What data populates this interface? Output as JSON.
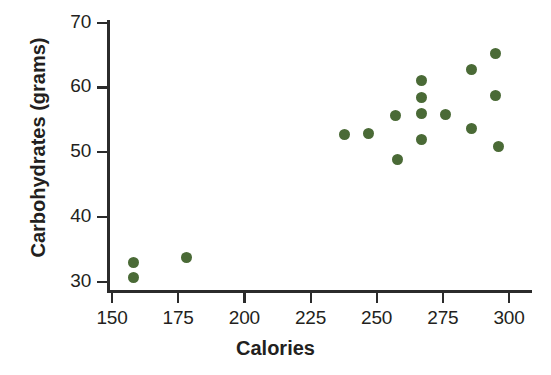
{
  "chart_data": {
    "type": "scatter",
    "title": "",
    "xlabel": "Calories",
    "ylabel": "Carbohydrates (grams)",
    "xlim": [
      150,
      310
    ],
    "ylim": [
      28,
      70
    ],
    "xticks": [
      150,
      175,
      200,
      225,
      250,
      275,
      300
    ],
    "yticks": [
      30,
      40,
      50,
      60,
      70
    ],
    "grid": false,
    "legend": null,
    "marker_color": "#4a6a36",
    "axis_color": "#2b2b2b",
    "background_color": "#ffffff",
    "points": [
      {
        "x": 158,
        "y": 33
      },
      {
        "x": 158,
        "y": 30.7
      },
      {
        "x": 178,
        "y": 33.7
      },
      {
        "x": 238,
        "y": 52.8
      },
      {
        "x": 247,
        "y": 52.9
      },
      {
        "x": 257,
        "y": 55.7
      },
      {
        "x": 258,
        "y": 48.8
      },
      {
        "x": 267,
        "y": 61
      },
      {
        "x": 267,
        "y": 58.5
      },
      {
        "x": 267,
        "y": 55.9
      },
      {
        "x": 267,
        "y": 52
      },
      {
        "x": 276,
        "y": 55.8
      },
      {
        "x": 286,
        "y": 62.8
      },
      {
        "x": 286,
        "y": 53.7
      },
      {
        "x": 295,
        "y": 65.2
      },
      {
        "x": 295,
        "y": 58.7
      },
      {
        "x": 296,
        "y": 50.9
      }
    ]
  }
}
